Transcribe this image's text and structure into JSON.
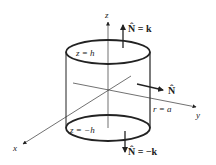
{
  "diagram": {
    "type": "cylinder-surface-normals",
    "axes": {
      "z": "z",
      "y": "y",
      "x": "x"
    },
    "labels": {
      "top_plane": "z = h",
      "bottom_plane": "z = −h",
      "radius": "r = a",
      "top_normal": "N̂ = k",
      "side_normal": "N̂",
      "bottom_normal": "N̂ = −k"
    },
    "colors": {
      "stroke": "#222222",
      "background": "#ffffff"
    }
  }
}
